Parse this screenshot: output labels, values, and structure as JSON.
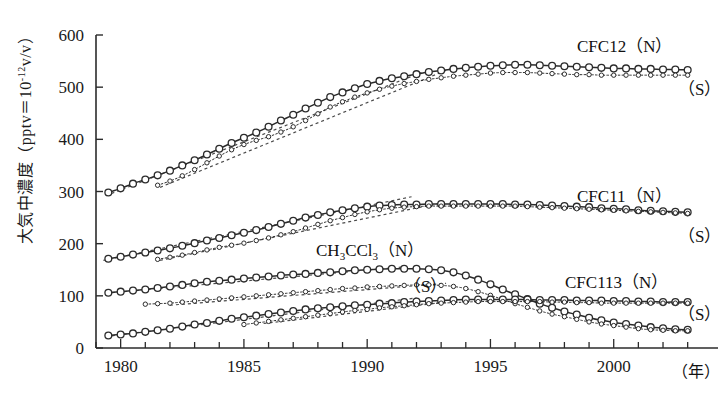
{
  "figure": {
    "background_color": "#ffffff",
    "line_color": "#2b2b2b",
    "marker_fill": "#ffffff"
  },
  "axes": {
    "y_label_prefix": "大気中濃度（pptv＝10",
    "y_label_exponent": "-12",
    "y_label_suffix": "v/v）",
    "y_ticks": [
      "0",
      "100",
      "200",
      "300",
      "400",
      "500",
      "600"
    ],
    "y_min": 0,
    "y_max": 600,
    "x_ticks": [
      "1980",
      "1985",
      "1990",
      "1995",
      "2000"
    ],
    "x_min": 1979,
    "x_max": 2003.5,
    "x_unit_label": "（年）",
    "x_minor_tick_interval": 1
  },
  "legend": {
    "cfc12": {
      "name": "CFC12",
      "north": "（N）",
      "south": "（S）"
    },
    "cfc11": {
      "name": "CFC11",
      "north": "（N）",
      "south": "（S）"
    },
    "ch3ccl3": {
      "name_pre": "CH",
      "name_sub1": "3",
      "name_mid": "CCl",
      "name_sub2": "3",
      "north": "（N）",
      "south": "（S）"
    },
    "cfc113": {
      "name": "CFC113",
      "north": "（N）",
      "south": "（S）"
    }
  },
  "chart_data": {
    "type": "line",
    "title": "",
    "xlabel": "（年）",
    "ylabel": "大気中濃度（pptv＝10⁻¹²v/v）",
    "xlim": [
      1979,
      2003.5
    ],
    "ylim": [
      0,
      600
    ],
    "grid": false,
    "legend_position": "inline-right",
    "x": [
      1979.5,
      1980,
      1980.5,
      1981,
      1981.5,
      1982,
      1982.5,
      1983,
      1983.5,
      1984,
      1984.5,
      1985,
      1985.5,
      1986,
      1986.5,
      1987,
      1987.5,
      1988,
      1988.5,
      1989,
      1989.5,
      1990,
      1990.5,
      1991,
      1991.5,
      1992,
      1992.5,
      1993,
      1993.5,
      1994,
      1994.5,
      1995,
      1995.5,
      1996,
      1996.5,
      1997,
      1997.5,
      1998,
      1998.5,
      1999,
      1999.5,
      2000,
      2000.5,
      2001,
      2001.5,
      2002,
      2002.5,
      2003
    ],
    "series": [
      {
        "name": "CFC12 (N)",
        "hemisphere": "N",
        "style": "solid",
        "marker": "open-circle-large",
        "values": [
          298,
          306,
          315,
          323,
          331,
          340,
          350,
          360,
          371,
          382,
          393,
          403,
          413,
          424,
          436,
          447,
          459,
          470,
          481,
          490,
          498,
          506,
          512,
          517,
          521,
          525,
          529,
          532,
          535,
          537,
          539,
          541,
          542,
          543,
          543,
          542,
          541,
          540,
          539,
          538,
          537,
          536,
          536,
          535,
          535,
          534,
          534,
          533
        ]
      },
      {
        "name": "CFC12 (S)",
        "hemisphere": "S",
        "style": "dotted",
        "marker": "open-circle-small",
        "values": [
          null,
          null,
          null,
          null,
          312,
          320,
          330,
          342,
          355,
          368,
          380,
          390,
          398,
          405,
          414,
          424,
          436,
          449,
          462,
          472,
          481,
          489,
          496,
          502,
          507,
          511,
          515,
          518,
          521,
          523,
          525,
          527,
          528,
          528,
          528,
          527,
          526,
          525,
          524,
          524,
          523,
          523,
          523,
          523,
          523,
          523,
          523,
          523
        ]
      },
      {
        "name": "CFC11 (N)",
        "hemisphere": "N",
        "style": "solid",
        "marker": "open-circle-large",
        "values": [
          171,
          175,
          179,
          183,
          187,
          191,
          196,
          201,
          206,
          211,
          216,
          221,
          226,
          232,
          238,
          244,
          250,
          255,
          260,
          264,
          268,
          271,
          273,
          274,
          275,
          275,
          276,
          276,
          276,
          276,
          276,
          276,
          276,
          275,
          275,
          274,
          273,
          272,
          271,
          270,
          268,
          267,
          266,
          264,
          263,
          262,
          261,
          260
        ]
      },
      {
        "name": "CFC11 (S)",
        "hemisphere": "S",
        "style": "dotted",
        "marker": "open-circle-small",
        "values": [
          null,
          null,
          null,
          null,
          170,
          174,
          178,
          183,
          188,
          193,
          197,
          201,
          206,
          211,
          217,
          223,
          230,
          237,
          244,
          250,
          256,
          261,
          265,
          268,
          270,
          271,
          272,
          272,
          272,
          272,
          272,
          272,
          272,
          272,
          271,
          270,
          269,
          268,
          267,
          266,
          265,
          264,
          263,
          262,
          261,
          260,
          259,
          258
        ]
      },
      {
        "name": "CH3CCl3 (N)",
        "hemisphere": "N",
        "style": "solid",
        "marker": "open-circle-large",
        "values": [
          106,
          108,
          110,
          112,
          115,
          118,
          121,
          124,
          127,
          129,
          131,
          133,
          135,
          137,
          139,
          141,
          142,
          144,
          145,
          147,
          149,
          150,
          151,
          152,
          152,
          152,
          151,
          149,
          145,
          139,
          131,
          122,
          112,
          103,
          94,
          85,
          77,
          70,
          64,
          58,
          53,
          49,
          46,
          43,
          40,
          38,
          36,
          35
        ]
      },
      {
        "name": "CH3CCl3 (S)",
        "hemisphere": "S",
        "style": "dotted",
        "marker": "open-circle-small",
        "values": [
          null,
          null,
          null,
          84,
          85,
          86,
          88,
          90,
          92,
          94,
          96,
          98,
          100,
          102,
          104,
          106,
          108,
          110,
          112,
          114,
          115,
          117,
          118,
          119,
          120,
          121,
          121,
          120,
          118,
          114,
          108,
          101,
          93,
          85,
          78,
          71,
          65,
          60,
          55,
          50,
          46,
          43,
          40,
          37,
          35,
          34,
          33,
          33
        ]
      },
      {
        "name": "CFC113 (N)",
        "hemisphere": "N",
        "style": "solid",
        "marker": "open-circle-large",
        "values": [
          24,
          26,
          28,
          31,
          34,
          37,
          41,
          45,
          48,
          52,
          56,
          59,
          62,
          65,
          68,
          71,
          74,
          76,
          78,
          80,
          82,
          83,
          85,
          86,
          88,
          89,
          90,
          91,
          92,
          93,
          93,
          93,
          93,
          93,
          93,
          92,
          92,
          92,
          91,
          91,
          91,
          90,
          90,
          89,
          89,
          88,
          88,
          88
        ]
      },
      {
        "name": "CFC113 (S)",
        "hemisphere": "S",
        "style": "dotted",
        "marker": "open-circle-small",
        "values": [
          null,
          null,
          null,
          null,
          null,
          null,
          null,
          null,
          null,
          null,
          null,
          45,
          48,
          51,
          54,
          57,
          60,
          63,
          66,
          69,
          72,
          74,
          77,
          79,
          81,
          83,
          85,
          86,
          87,
          88,
          89,
          89,
          89,
          89,
          89,
          89,
          88,
          88,
          87,
          87,
          86,
          86,
          86,
          86,
          86,
          86,
          86,
          86
        ]
      }
    ],
    "trend_lines": [
      {
        "name": "CFC12 N trend",
        "x0": 1979.4,
        "y0": 292,
        "x1": 1992.2,
        "y1": 528
      },
      {
        "name": "CFC12 S trend",
        "x0": 1981.6,
        "y0": 308,
        "x1": 1993.4,
        "y1": 536
      },
      {
        "name": "CFC11 N trend",
        "x0": 1979.3,
        "y0": 168,
        "x1": 1991.8,
        "y1": 290
      },
      {
        "name": "CFC11 S trend",
        "x0": 1981.6,
        "y0": 168,
        "x1": 1993.0,
        "y1": 278
      },
      {
        "name": "CH3CCl3 N trend",
        "x0": 1979.4,
        "y0": 105,
        "x1": 1991.6,
        "y1": 156
      },
      {
        "name": "CH3CCl3 S trend",
        "x0": 1982.0,
        "y0": 82,
        "x1": 1993.2,
        "y1": 124
      },
      {
        "name": "CFC113 N trend",
        "x0": 1979.4,
        "y0": 22,
        "x1": 1992.0,
        "y1": 96
      },
      {
        "name": "CFC113 S trend",
        "x0": 1985.8,
        "y0": 47,
        "x1": 1993.2,
        "y1": 88
      }
    ]
  }
}
